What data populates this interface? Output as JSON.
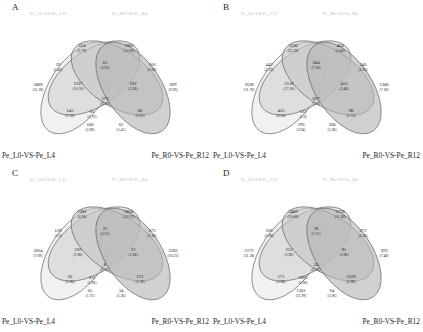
{
  "figure": {
    "background": "#ffffff",
    "type": "four-set-venn-grid",
    "panel_count": 4
  },
  "style": {
    "ellipse_stroke": "#5a5a5a",
    "fill_a": "#e8e8e8",
    "fill_b": "#d2d2d2",
    "fill_c": "#c6c6c6",
    "fill_d": "#b4b4b4",
    "top_label_color": "#b9b9b9",
    "bottom_label_color": "#1c1c1c"
  },
  "region_order": [
    "A_only",
    "B_only",
    "C_only",
    "D_only",
    "AB",
    "AC",
    "AD",
    "BC",
    "BD",
    "CD",
    "ABC",
    "ABD",
    "ACD",
    "BCD",
    "ABCD"
  ],
  "panels": [
    {
      "letter": "A",
      "top_left_label": "Pe_L0-VS-Pe_L12",
      "top_right_label": "Pe_R0-VS-Pe_R4",
      "bottom_left_label": "Pe_L0-VS-Pe_L4",
      "bottom_right_label": "Pe_R0-VS-Pe_R12",
      "regions": {
        "A_only": {
          "count": "2009",
          "pct": "(11.38)"
        },
        "B_only": {
          "count": "224",
          "pct": "(1.79)"
        },
        "C_only": {
          "count": "1902",
          "pct": "(12.62)"
        },
        "D_only": {
          "count": "699",
          "pct": "(9.29)"
        },
        "AB": {
          "count": "19",
          "pct": "(1.41)"
        },
        "AC": {
          "count": "1337",
          "pct": "(10.78)"
        },
        "AD": {
          "count": "145",
          "pct": "(7.19)"
        },
        "BC": {
          "count": "61",
          "pct": "(1.91)"
        },
        "BD": {
          "count": "192",
          "pct": "(2.38)"
        },
        "CD": {
          "count": "166",
          "pct": "(1.98)"
        },
        "ABC": {
          "count": "61",
          "pct": "(1.19)"
        },
        "ABD": {
          "count": "100",
          "pct": "(2.98)"
        },
        "ACD": {
          "count": "62",
          "pct": "(1.41)"
        },
        "BCD": {
          "count": "86",
          "pct": "(1.91)"
        },
        "ABCD": {
          "count": "176",
          "pct": "(2.19)"
        }
      }
    },
    {
      "letter": "B",
      "top_left_label": "Pe_L0-VS-Pe_L12",
      "top_right_label": "Pe_R0-VS-Pe_R4",
      "bottom_left_label": "Pe_L0-VS-Pe_L4",
      "bottom_right_label": "Pe_R0-VS-Pe_R12",
      "regions": {
        "A_only": {
          "count": "1638",
          "pct": "(11.78)"
        },
        "B_only": {
          "count": "1520",
          "pct": "(11.29)"
        },
        "C_only": {
          "count": "464",
          "pct": "(5.40)"
        },
        "D_only": {
          "count": "1300",
          "pct": "(7.18)"
        },
        "AB": {
          "count": "443",
          "pct": "(2.72)"
        },
        "AC": {
          "count": "2118",
          "pct": "(17.18)"
        },
        "AD": {
          "count": "435",
          "pct": "(2.30)"
        },
        "BC": {
          "count": "304",
          "pct": "(7.18)"
        },
        "BD": {
          "count": "455",
          "pct": "(3.46)"
        },
        "CD": {
          "count": "346",
          "pct": "(1.96)"
        },
        "ABC": {
          "count": "131",
          "pct": "(1.6)"
        },
        "ABD": {
          "count": "196",
          "pct": "(2.94)"
        },
        "ACD": {
          "count": "100",
          "pct": "(1.38)"
        },
        "BCD": {
          "count": "98",
          "pct": "(1.71)"
        },
        "ABCD": {
          "count": "637",
          "pct": "(5.0)"
        }
      }
    },
    {
      "letter": "C",
      "top_left_label": "Pe_L4-VS-Pe_L12",
      "top_right_label": "Pe_R0-VS-Pe_R4",
      "bottom_left_label": "Pe_L0-VS-Pe_L4",
      "bottom_right_label": "Pe_R0-VS-Pe_R12",
      "regions": {
        "A_only": {
          "count": "1824",
          "pct": "(7.09)"
        },
        "B_only": {
          "count": "1281",
          "pct": "(4.38)"
        },
        "C_only": {
          "count": "2830",
          "pct": "(12.31)"
        },
        "D_only": {
          "count": "3183",
          "pct": "(16.31)"
        },
        "AB": {
          "count": "129",
          "pct": "(1.2)"
        },
        "AC": {
          "count": "236",
          "pct": "(1.96)"
        },
        "AD": {
          "count": "62",
          "pct": "(1.96)"
        },
        "BC": {
          "count": "21",
          "pct": "(1.21)"
        },
        "BD": {
          "count": "23",
          "pct": "(1.38)"
        },
        "CD": {
          "count": "272",
          "pct": "(1.28)"
        },
        "ABC": {
          "count": "311",
          "pct": "(1.96)"
        },
        "ABD": {
          "count": "65",
          "pct": "(1.72)"
        },
        "ACD": {
          "count": "34",
          "pct": "(1.36)"
        },
        "BCD": {
          "count": "271",
          "pct": "(1.78)"
        },
        "ABCD": {
          "count": "8",
          "pct": "(1.31)"
        }
      }
    },
    {
      "letter": "D",
      "top_left_label": "Pe_L4-VS-Pe_L12",
      "top_right_label": "Pe_R0-VS-Pe_R4",
      "bottom_left_label": "Pe_L0-VS-Pe_L4",
      "bottom_right_label": "Pe_R0-VS-Pe_R12",
      "regions": {
        "A_only": {
          "count": "2172",
          "pct": "(11.38)"
        },
        "B_only": {
          "count": "3409",
          "pct": "(18.08)"
        },
        "C_only": {
          "count": "2750",
          "pct": "(11.36)"
        },
        "D_only": {
          "count": "393",
          "pct": "(7.48)"
        },
        "AB": {
          "count": "166",
          "pct": "(1.98)"
        },
        "AC": {
          "count": "232",
          "pct": "(1.96)"
        },
        "AD": {
          "count": "171",
          "pct": "(1.96)"
        },
        "BC": {
          "count": "78",
          "pct": "(1.71)"
        },
        "BD": {
          "count": "81",
          "pct": "(2.96)"
        },
        "CD": {
          "count": "272",
          "pct": "(1.38)"
        },
        "ABC": {
          "count": "1093",
          "pct": "(1.98)"
        },
        "ABD": {
          "count": "1301",
          "pct": "(11.99)"
        },
        "ACD": {
          "count": "64",
          "pct": "(1.96)"
        },
        "BCD": {
          "count": "1169",
          "pct": "(1.99)"
        },
        "ABCD": {
          "count": "24",
          "pct": "(1.39)"
        }
      }
    }
  ]
}
